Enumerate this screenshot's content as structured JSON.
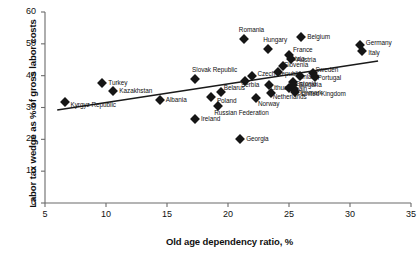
{
  "chart_data": {
    "type": "scatter",
    "title": "",
    "xlabel": "Old age dependency ratio, %",
    "ylabel": "Labor tax wedge as % of gross labor costs",
    "xlim": [
      5,
      35
    ],
    "ylim": [
      0,
      60
    ],
    "xticks": [
      5,
      10,
      15,
      20,
      25,
      30,
      35
    ],
    "yticks": [
      0,
      10,
      20,
      30,
      40,
      50,
      60
    ],
    "grid": false,
    "legend": "none",
    "marker": "diamond",
    "marker_color": "#151515",
    "trendline": {
      "show": true,
      "x": [
        6.0,
        32.3
      ],
      "y": [
        29.2,
        44.6
      ],
      "color": "#1a1a1a"
    },
    "points": [
      {
        "label": "Kyrgyz Republic",
        "x": 6.6,
        "y": 31.8,
        "label_dx": 6,
        "label_dy": 3
      },
      {
        "label": "Turkey",
        "x": 9.7,
        "y": 37.6,
        "label_dx": 6,
        "label_dy": 0
      },
      {
        "label": "Kazakhstan",
        "x": 10.6,
        "y": 35.1,
        "label_dx": 6,
        "label_dy": 0
      },
      {
        "label": "Albania",
        "x": 14.4,
        "y": 32.4,
        "label_dx": 6,
        "label_dy": 0
      },
      {
        "label": "Slovak Republic",
        "x": 17.3,
        "y": 38.9,
        "label_dx": -3,
        "label_dy": -9
      },
      {
        "label": "Ireland",
        "x": 17.3,
        "y": 26.4,
        "label_dx": 6,
        "label_dy": 0
      },
      {
        "label": "Poland",
        "x": 18.6,
        "y": 33.3,
        "label_dx": 6,
        "label_dy": 4
      },
      {
        "label": "Belarus",
        "x": 19.4,
        "y": 34.8,
        "label_dx": 3,
        "label_dy": -4
      },
      {
        "label": "Russian Federation",
        "x": 19.2,
        "y": 30.6,
        "label_dx": -4,
        "label_dy": 7
      },
      {
        "label": "Georgia",
        "x": 21.0,
        "y": 20.0,
        "label_dx": 6,
        "label_dy": 0
      },
      {
        "label": "Romania",
        "x": 21.3,
        "y": 51.4,
        "label_dx": -5,
        "label_dy": -9
      },
      {
        "label": "Serbia",
        "x": 21.4,
        "y": 38.2,
        "label_dx": -4,
        "label_dy": 4
      },
      {
        "label": "Czech Republic",
        "x": 22.0,
        "y": 39.8,
        "label_dx": 5,
        "label_dy": -2
      },
      {
        "label": "Norway",
        "x": 22.3,
        "y": 33.1,
        "label_dx": 2,
        "label_dy": 6
      },
      {
        "label": "Hungary",
        "x": 23.3,
        "y": 48.3,
        "label_dx": -5,
        "label_dy": -9
      },
      {
        "label": "Lithuania",
        "x": 23.4,
        "y": 37.0,
        "label_dx": 1,
        "label_dy": 3
      },
      {
        "label": "Netherlands",
        "x": 23.5,
        "y": 34.7,
        "label_dx": 2,
        "label_dy": 4
      },
      {
        "label": "Slovenia",
        "x": 24.1,
        "y": 41.2,
        "label_dx": 0,
        "label_dy": -7
      },
      {
        "label": "Latvia",
        "x": 24.5,
        "y": 43.1,
        "label_dx": 5,
        "label_dy": -7
      },
      {
        "label": "France",
        "x": 25.0,
        "y": 46.4,
        "label_dx": 4,
        "label_dy": -5
      },
      {
        "label": "Austria",
        "x": 25.2,
        "y": 45.2,
        "label_dx": 5,
        "label_dy": 1
      },
      {
        "label": "Spain",
        "x": 25.0,
        "y": 36.1,
        "label_dx": 2,
        "label_dy": 1
      },
      {
        "label": "Estonia",
        "x": 25.3,
        "y": 38.0,
        "label_dx": 3,
        "label_dy": 2
      },
      {
        "label": "Denmark",
        "x": 25.4,
        "y": 35.9,
        "label_dx": 3,
        "label_dy": 4
      },
      {
        "label": "Bulgaria",
        "x": 25.3,
        "y": 37.0,
        "label_dx": 6,
        "label_dy": 0
      },
      {
        "label": "United Kingdom",
        "x": 25.5,
        "y": 34.9,
        "label_dx": 6,
        "label_dy": 2
      },
      {
        "label": "Finland",
        "x": 25.9,
        "y": 39.9,
        "label_dx": -2,
        "label_dy": 1
      },
      {
        "label": "Belgium",
        "x": 26.0,
        "y": 52.1,
        "label_dx": 6,
        "label_dy": 0
      },
      {
        "label": "Sweden",
        "x": 27.0,
        "y": 40.8,
        "label_dx": 2,
        "label_dy": -3
      },
      {
        "label": "Portugal",
        "x": 27.1,
        "y": 39.6,
        "label_dx": 3,
        "label_dy": 1
      },
      {
        "label": "Germany",
        "x": 30.8,
        "y": 49.5,
        "label_dx": 6,
        "label_dy": -2
      },
      {
        "label": "Italy",
        "x": 31.0,
        "y": 47.9,
        "label_dx": 6,
        "label_dy": 2
      }
    ]
  }
}
